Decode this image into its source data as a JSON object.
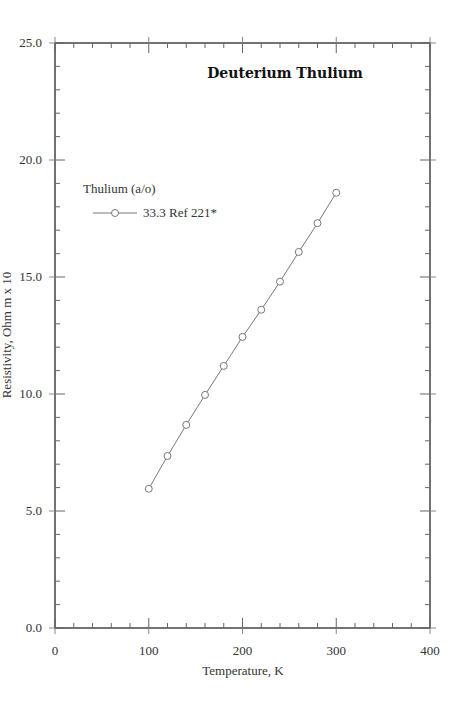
{
  "chart_data": {
    "type": "line",
    "title": "Deuterium Thulium",
    "xlabel": "Temperature,  K",
    "ylabel": "Resistivity, Ohm m x 10",
    "xlim": [
      0,
      400
    ],
    "ylim": [
      0.0,
      25.0
    ],
    "x_ticks": [
      "0",
      "100",
      "200",
      "300",
      "400"
    ],
    "y_ticks": [
      "0.0",
      "5.0",
      "10.0",
      "15.0",
      "20.0",
      "25.0"
    ],
    "x_minor_step": 20,
    "y_minor_step": 1.0,
    "grid": false,
    "legend": {
      "title": "Thulium (a/o)",
      "position": "upper-left",
      "entries": [
        "33.3 Ref 221*"
      ]
    },
    "series": [
      {
        "name": "33.3 Ref 221*",
        "marker": "open-circle",
        "x": [
          100,
          120,
          140,
          160,
          180,
          200,
          220,
          240,
          260,
          280,
          300
        ],
        "values": [
          5.95,
          7.35,
          8.68,
          9.96,
          11.2,
          12.44,
          13.6,
          14.8,
          16.07,
          17.3,
          18.6
        ]
      }
    ]
  }
}
